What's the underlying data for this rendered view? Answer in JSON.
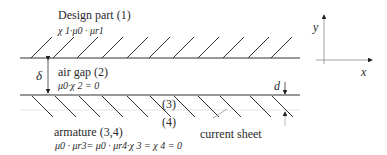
{
  "diagram": {
    "regions": {
      "design_part": {
        "title": "Design part (1)",
        "formula": "χ 1·μ0 · μr1"
      },
      "air_gap": {
        "title": "air gap (2)",
        "formula": "μ0·χ 2 = 0"
      },
      "armature": {
        "title": "armature (3,4)",
        "formula": "μ0 · μr3= μ0 · μr4·χ 3 = χ 4 = 0"
      }
    },
    "layer_labels": {
      "layer3": "(3)",
      "layer4": "(4)"
    },
    "dimensions": {
      "gap": "δ",
      "sheet_thickness": "d"
    },
    "annotations": {
      "current_sheet": "current sheet"
    },
    "axes": {
      "x": "x",
      "y": "y"
    },
    "colors": {
      "line": "#333333",
      "text": "#2a2a2a",
      "leader": "#999999"
    }
  }
}
